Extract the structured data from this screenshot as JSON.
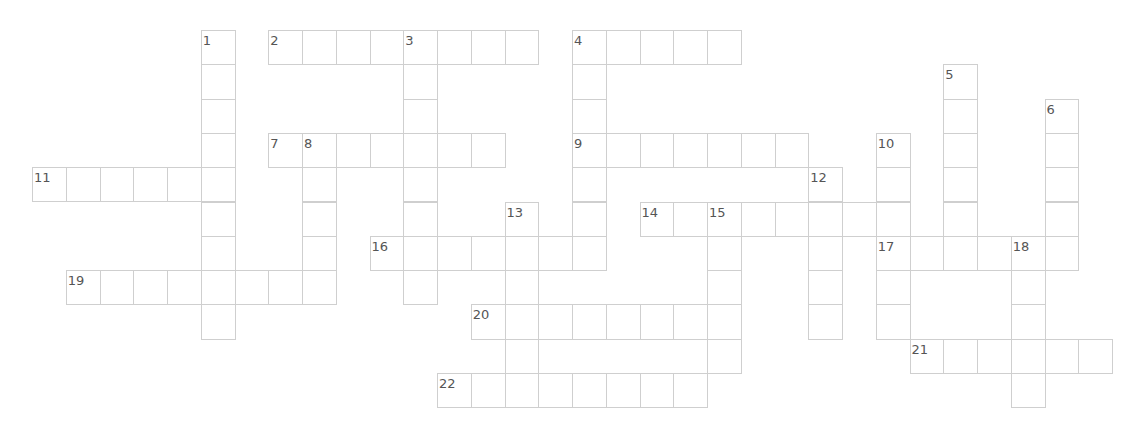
{
  "puzzle": {
    "type": "crossword",
    "grid_origin": {
      "x": 32,
      "y": 30
    },
    "cell_size": {
      "w": 33.75,
      "h": 34.3
    },
    "colors": {
      "border": "#cfcfcf",
      "number": "#555555",
      "cell_bg": "#ffffff"
    },
    "entries": [
      {
        "number": 1,
        "direction": "down",
        "row": 0,
        "col": 5,
        "length": 9
      },
      {
        "number": 2,
        "direction": "across",
        "row": 0,
        "col": 7,
        "length": 8
      },
      {
        "number": 3,
        "direction": "down",
        "row": 0,
        "col": 11,
        "length": 8
      },
      {
        "number": 4,
        "direction": "across",
        "row": 0,
        "col": 16,
        "length": 5
      },
      {
        "number": 4,
        "direction": "down",
        "row": 0,
        "col": 16,
        "length": 7
      },
      {
        "number": 5,
        "direction": "down",
        "row": 1,
        "col": 27,
        "length": 6
      },
      {
        "number": 6,
        "direction": "down",
        "row": 2,
        "col": 30,
        "length": 5
      },
      {
        "number": 7,
        "direction": "across",
        "row": 3,
        "col": 7,
        "length": 7
      },
      {
        "number": 8,
        "direction": "down",
        "row": 3,
        "col": 8,
        "length": 5
      },
      {
        "number": 9,
        "direction": "across",
        "row": 3,
        "col": 16,
        "length": 7
      },
      {
        "number": 10,
        "direction": "down",
        "row": 3,
        "col": 25,
        "length": 6
      },
      {
        "number": 11,
        "direction": "across",
        "row": 4,
        "col": 0,
        "length": 6
      },
      {
        "number": 12,
        "direction": "down",
        "row": 4,
        "col": 23,
        "length": 5
      },
      {
        "number": 13,
        "direction": "down",
        "row": 5,
        "col": 14,
        "length": 6
      },
      {
        "number": 14,
        "direction": "across",
        "row": 5,
        "col": 18,
        "length": 8
      },
      {
        "number": 15,
        "direction": "down",
        "row": 5,
        "col": 20,
        "length": 5
      },
      {
        "number": 16,
        "direction": "across",
        "row": 6,
        "col": 10,
        "length": 7
      },
      {
        "number": 17,
        "direction": "across",
        "row": 6,
        "col": 25,
        "length": 6
      },
      {
        "number": 18,
        "direction": "down",
        "row": 6,
        "col": 29,
        "length": 5
      },
      {
        "number": 19,
        "direction": "across",
        "row": 7,
        "col": 1,
        "length": 8
      },
      {
        "number": 20,
        "direction": "across",
        "row": 8,
        "col": 13,
        "length": 8
      },
      {
        "number": 21,
        "direction": "across",
        "row": 9,
        "col": 26,
        "length": 6
      },
      {
        "number": 22,
        "direction": "across",
        "row": 10,
        "col": 12,
        "length": 8
      }
    ]
  }
}
